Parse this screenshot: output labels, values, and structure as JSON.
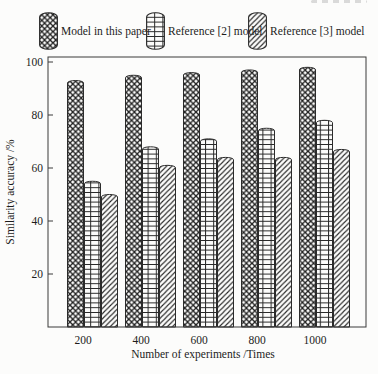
{
  "colors": {
    "line": "#2b2b2b",
    "frame": "#3a3a3a",
    "text": "#1c1c1c",
    "background": "#fcfcfb"
  },
  "legend": {
    "items": [
      {
        "label": "Model in this paper",
        "pattern": "crosshatch",
        "swatch_icon": "crosshatch-cylinder"
      },
      {
        "label": "Reference [2] model",
        "pattern": "grid",
        "swatch_icon": "grid-cylinder"
      },
      {
        "label": "Reference [3] model",
        "pattern": "diagonal",
        "swatch_icon": "diagonal-cylinder"
      }
    ]
  },
  "chart_data": {
    "type": "bar",
    "title": "",
    "xlabel": "Number of experiments /Times",
    "ylabel": "Similarity accuracy /%",
    "categories": [
      "200",
      "400",
      "600",
      "800",
      "1000"
    ],
    "series": [
      {
        "name": "Model in this paper",
        "pattern": "crosshatch",
        "values": [
          93,
          95,
          96,
          97,
          98
        ]
      },
      {
        "name": "Reference [2] model",
        "pattern": "grid",
        "values": [
          55,
          68,
          71,
          75,
          78
        ]
      },
      {
        "name": "Reference [3] model",
        "pattern": "diagonal",
        "values": [
          50,
          61,
          64,
          64,
          67
        ]
      }
    ],
    "ylim": [
      0,
      100
    ],
    "yticks": [
      20,
      40,
      60,
      80,
      100
    ],
    "grid": false,
    "legend_position": "top",
    "bar_style": "hatched-cylinder"
  }
}
